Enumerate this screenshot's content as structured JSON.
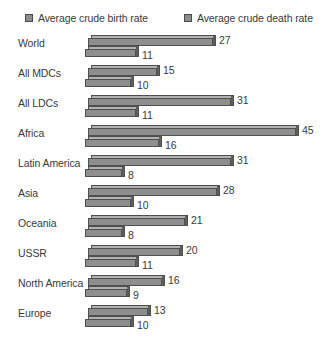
{
  "legend": {
    "series": [
      {
        "label": "Average crude birth rate",
        "swatch": "birth-rate-swatch",
        "color": "#8d8d8d"
      },
      {
        "label": "Average crude death rate",
        "swatch": "death-rate-swatch",
        "color": "#8d8d8d"
      }
    ]
  },
  "chart_data": {
    "type": "bar",
    "orientation": "horizontal",
    "title": "",
    "xlabel": "",
    "ylabel": "",
    "grid": false,
    "legend_position": "top",
    "xlim": [
      0,
      45
    ],
    "categories": [
      "World",
      "All MDCs",
      "All LDCs",
      "Africa",
      "Latin America",
      "Asia",
      "Oceania",
      "USSR",
      "North America",
      "Europe"
    ],
    "series": [
      {
        "name": "Average crude birth rate",
        "values": [
          27,
          15,
          31,
          45,
          31,
          28,
          21,
          20,
          16,
          13
        ]
      },
      {
        "name": "Average crude death rate",
        "values": [
          11,
          10,
          11,
          16,
          8,
          10,
          8,
          11,
          9,
          10
        ]
      }
    ]
  }
}
